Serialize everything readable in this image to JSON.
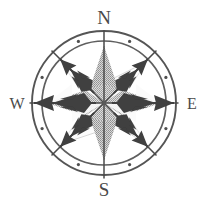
{
  "figure": {
    "name": "compass-rose",
    "background_color": "#ffffff",
    "width": 209,
    "height": 209
  },
  "geometry": {
    "center_x": 104,
    "center_y": 103,
    "outer_ring_radius": 72,
    "inner_ring_radius": 62,
    "star_radius": 57,
    "tick_dot_radius": 67,
    "tick_dot_size": 1.6,
    "arrow_tail_radius": 70,
    "axis_arrow_length": 74
  },
  "colors": {
    "background": "#ffffff",
    "ring_stroke": "#5b5b5b",
    "ring_stroke_light": "#8a8a8a",
    "star_light": "#fdfdfd",
    "star_shaded": "#b3b3b3",
    "star_shaded_alt": "#c4c4c4",
    "star_outline": "#9a9a9a",
    "arrow_dark": "#3d3d3d",
    "arrow_mid": "#565656",
    "label_color": "#4a4a4a",
    "tick_dot": "#5b5b5b"
  },
  "cardinals": [
    {
      "id": "north",
      "label": "N",
      "abbr": "N",
      "bearing_deg": 0,
      "x": 104,
      "y": 24,
      "anchor": "middle"
    },
    {
      "id": "east",
      "label": "E",
      "abbr": "E",
      "bearing_deg": 90,
      "x": 192,
      "y": 109,
      "anchor": "middle"
    },
    {
      "id": "south",
      "label": "S",
      "abbr": "S",
      "bearing_deg": 180,
      "x": 104,
      "y": 196,
      "anchor": "middle"
    },
    {
      "id": "west",
      "label": "W",
      "abbr": "W",
      "bearing_deg": 270,
      "x": 17,
      "y": 109,
      "anchor": "middle"
    }
  ],
  "intercardinals": [
    {
      "id": "northeast",
      "abbr": "NE",
      "bearing_deg": 45
    },
    {
      "id": "southeast",
      "abbr": "SE",
      "bearing_deg": 135
    },
    {
      "id": "southwest",
      "abbr": "SW",
      "bearing_deg": 225
    },
    {
      "id": "northwest",
      "abbr": "NW",
      "bearing_deg": 315
    }
  ],
  "star_points": [
    {
      "id": "point-n",
      "bearing_deg": 0,
      "shade": "shaded"
    },
    {
      "id": "point-ne",
      "bearing_deg": 45,
      "shade": "light"
    },
    {
      "id": "point-e",
      "bearing_deg": 90,
      "shade": "shaded"
    },
    {
      "id": "point-se",
      "bearing_deg": 135,
      "shade": "light"
    },
    {
      "id": "point-s",
      "bearing_deg": 180,
      "shade": "shaded"
    },
    {
      "id": "point-sw",
      "bearing_deg": 225,
      "shade": "light"
    },
    {
      "id": "point-w",
      "bearing_deg": 270,
      "shade": "shaded"
    },
    {
      "id": "point-nw",
      "bearing_deg": 315,
      "shade": "light"
    }
  ],
  "arrows": [
    {
      "id": "arrow-west",
      "bearing_deg": 270,
      "style": "barbed-axis",
      "direction": "outward"
    },
    {
      "id": "arrow-east",
      "bearing_deg": 90,
      "style": "barbed-axis",
      "direction": "outward"
    },
    {
      "id": "arrow-northeast",
      "bearing_deg": 45,
      "style": "barbed-diagonal",
      "direction": "outward"
    },
    {
      "id": "arrow-northwest",
      "bearing_deg": 315,
      "style": "barbed-diagonal",
      "direction": "outward"
    },
    {
      "id": "arrow-southeast",
      "bearing_deg": 135,
      "style": "barbed-diagonal",
      "direction": "outward"
    },
    {
      "id": "arrow-southwest",
      "bearing_deg": 225,
      "style": "barbed-diagonal",
      "direction": "outward"
    }
  ],
  "tick_dots_bearings": [
    22.5,
    67.5,
    112.5,
    157.5,
    202.5,
    247.5,
    292.5,
    337.5
  ]
}
